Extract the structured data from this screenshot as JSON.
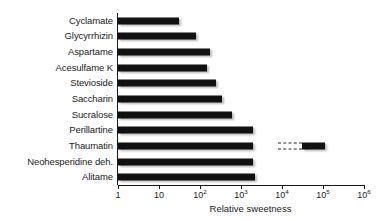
{
  "chart_data": {
    "type": "bar",
    "orientation": "horizontal",
    "title": "",
    "xlabel": "Relative sweetness",
    "ylabel": "",
    "xscale": "log",
    "xlim": [
      1,
      1000000
    ],
    "grid": false,
    "legend": null,
    "tick_labels": [
      "1",
      "10",
      "10²",
      "10³",
      "10⁴",
      "10⁵",
      "10⁶"
    ],
    "tick_values": [
      1,
      10,
      100,
      1000,
      10000,
      100000,
      1000000
    ],
    "tick_mantissa": [
      "1",
      "10",
      "10",
      "10",
      "10",
      "10",
      "10"
    ],
    "tick_exponent": [
      "",
      "",
      "2",
      "3",
      "4",
      "5",
      "6"
    ],
    "categories": [
      "Cyclamate",
      "Glycyrrhizin",
      "Aspartame",
      "Acesulfame K",
      "Stevioside",
      "Saccharin",
      "Sucralose",
      "Perillartine",
      "Thaumatin",
      "Neohesperidine deh.",
      "Alitame"
    ],
    "values": [
      30,
      80,
      180,
      150,
      250,
      350,
      600,
      2000,
      2000,
      2000,
      2200
    ],
    "bars": [
      {
        "label": "Cyclamate",
        "start": 1,
        "end": 30
      },
      {
        "label": "Glycyrrhizin",
        "start": 1,
        "end": 80
      },
      {
        "label": "Aspartame",
        "start": 1,
        "end": 180
      },
      {
        "label": "Acesulfame K",
        "start": 1,
        "end": 150
      },
      {
        "label": "Stevioside",
        "start": 1,
        "end": 250
      },
      {
        "label": "Saccharin",
        "start": 1,
        "end": 350
      },
      {
        "label": "Sucralose",
        "start": 1,
        "end": 600
      },
      {
        "label": "Perillartine",
        "start": 1,
        "end": 2000
      },
      {
        "label": "Thaumatin",
        "start": 1,
        "end": 2000
      },
      {
        "label": "Neohesperidine deh.",
        "start": 1,
        "end": 2000
      },
      {
        "label": "Alitame",
        "start": 1,
        "end": 2200
      }
    ],
    "extra_segments": [
      {
        "label": "Thaumatin",
        "row": 8,
        "kind": "dashed-gap",
        "start": 8000,
        "end": 30000
      },
      {
        "label": "Thaumatin",
        "row": 8,
        "kind": "solid",
        "start": 30000,
        "end": 110000
      }
    ]
  },
  "axis_title": "Relative sweetness"
}
